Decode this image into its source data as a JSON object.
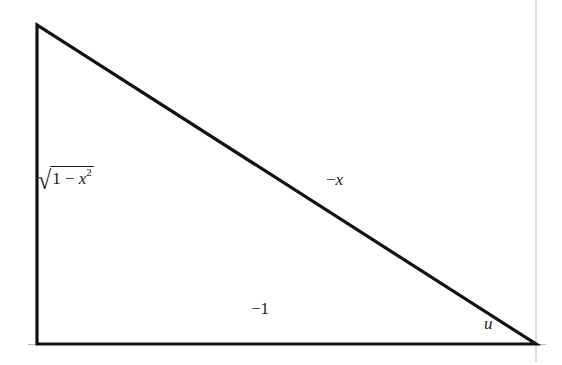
{
  "diagram": {
    "type": "right-triangle",
    "vertices": {
      "top_left": [
        37,
        25
      ],
      "bottom_left": [
        37,
        344
      ],
      "bottom_right": [
        536,
        344
      ]
    },
    "stroke_color": "#111111",
    "axis_color": "#b0b0b0",
    "labels": {
      "vertical_side": {
        "prefix": "1 − ",
        "var": "x",
        "exp": "2",
        "radical": "√"
      },
      "hypotenuse": {
        "sign": "−",
        "var": "x"
      },
      "base": "−1",
      "angle": "u"
    }
  }
}
